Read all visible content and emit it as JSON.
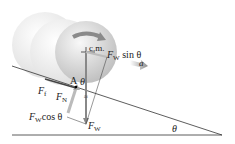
{
  "diagram": {
    "labels": {
      "cm": "c.m.",
      "fw_sin": "F",
      "fw_sin_sub": "W",
      "fw_sin_suffix": "sin θ",
      "a": "a",
      "A": "A",
      "theta_top": "θ",
      "ff": "F",
      "ff_sub": "f",
      "fn": "F",
      "fn_sub": "N",
      "fw_cos": "F",
      "fw_cos_sub": "W",
      "fw_cos_suffix": "cos θ",
      "fw": "F",
      "fw_sub": "W",
      "theta_angle": "θ"
    },
    "colors": {
      "ball": "#cfcfcf",
      "ghost_ball": "#ececec",
      "line": "#333333",
      "arrow": "#9a9a9a"
    }
  }
}
